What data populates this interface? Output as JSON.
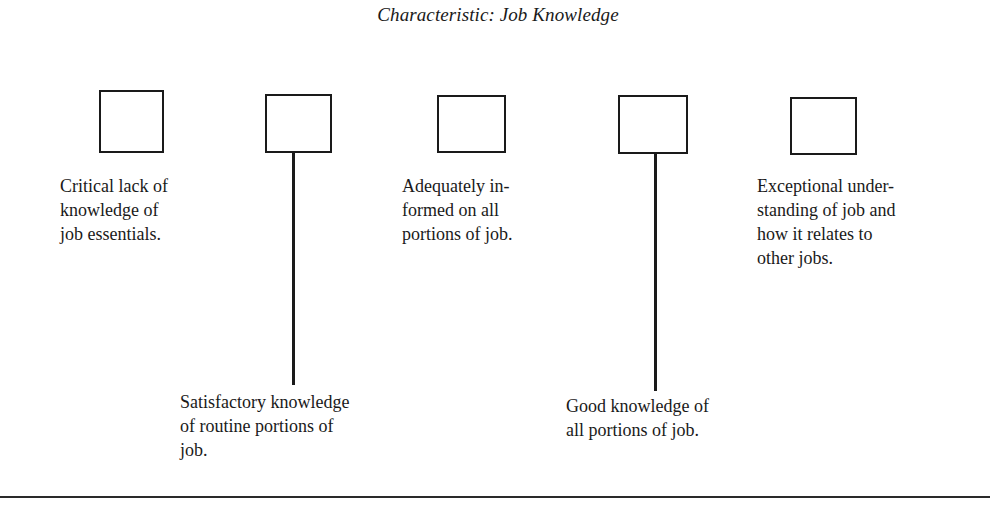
{
  "document": {
    "title": "Characteristic: Job Knowledge",
    "scale": {
      "points": [
        {
          "id": 1,
          "description": "Critical lack of\nknowledge of\njob essentials.",
          "label_position": "top",
          "checked": false
        },
        {
          "id": 2,
          "description": "Satisfactory knowledge\nof routine portions of\njob.",
          "label_position": "bottom",
          "checked": false
        },
        {
          "id": 3,
          "description": "Adequately in-\nformed on all\nportions of job.",
          "label_position": "top",
          "checked": false
        },
        {
          "id": 4,
          "description": "Good knowledge of\nall portions of job.",
          "label_position": "bottom",
          "checked": false
        },
        {
          "id": 5,
          "description": "Exceptional under-\nstanding of job and\nhow it relates to\nother jobs.",
          "label_position": "top",
          "checked": false
        }
      ]
    }
  }
}
